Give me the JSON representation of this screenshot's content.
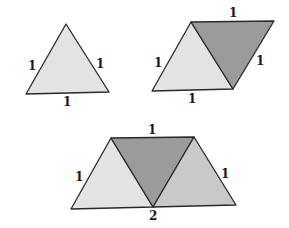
{
  "colors": {
    "light": "#e3e3e3",
    "medium": "#c9c9c9",
    "dark": "#9b9b9b",
    "stroke": "#2a2a2a",
    "background": "#ffffff"
  },
  "figures": [
    {
      "name": "single-equilateral-triangle",
      "labels": {
        "left": "1",
        "right": "1",
        "bottom": "1"
      }
    },
    {
      "name": "rhombus-two-triangles",
      "labels": {
        "top": "1",
        "left": "1",
        "right": "1",
        "bottom": "1"
      }
    },
    {
      "name": "trapezoid-three-triangles",
      "labels": {
        "top": "1",
        "left": "1",
        "right": "1",
        "bottom": "2"
      }
    }
  ]
}
